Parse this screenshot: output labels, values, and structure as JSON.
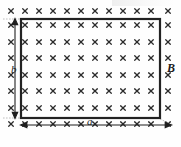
{
  "figure": {
    "labels": {
      "width": "a",
      "height": "b",
      "field": "B"
    },
    "colors": {
      "ink": "#1a1a1a",
      "loop_stroke": "#222222",
      "cross_stroke": "#2b2b2b",
      "background": "#fefefe",
      "guide": "#aaaaaa"
    },
    "loop": {
      "x": 21,
      "y": 19,
      "width": 139,
      "height": 99,
      "stroke_width": 2.2
    },
    "field_marks": {
      "symbol": "x",
      "direction": "into-page",
      "columns": 12,
      "rows": 8,
      "x_positions": [
        11,
        25,
        39,
        53,
        67,
        81,
        95,
        109,
        123,
        137,
        151,
        168
      ],
      "y_positions": [
        11,
        25,
        42,
        58,
        75,
        91,
        108,
        124
      ],
      "size": 4.6,
      "stroke_width": 1.25
    },
    "dimension_arrows": [
      {
        "name": "height-arrow-b",
        "orientation": "vertical",
        "x": 15,
        "y1": 19,
        "y2": 118,
        "label": "b",
        "double_headed": true
      },
      {
        "name": "width-arrow-a",
        "orientation": "horizontal",
        "y": 125,
        "x1": 21,
        "x2": 160,
        "label": "a",
        "double_headed": true
      }
    ],
    "guide_lines": [
      {
        "name": "top-left-guide",
        "x1": 4,
        "y1": 19,
        "x2": 24,
        "y2": 19
      },
      {
        "name": "bottom-left-guide",
        "x1": 4,
        "y1": 118,
        "x2": 24,
        "y2": 118
      },
      {
        "name": "bottom-right-guide",
        "x1": 160,
        "y1": 118,
        "x2": 172,
        "y2": 125
      }
    ]
  }
}
